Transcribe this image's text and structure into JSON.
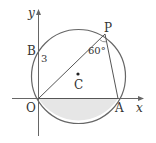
{
  "diagram": {
    "axes": {
      "x_label": "x",
      "y_label": "y"
    },
    "points": {
      "O": {
        "label": "O"
      },
      "A": {
        "label": "A"
      },
      "P": {
        "label": "P"
      },
      "B": {
        "label": "B"
      },
      "C": {
        "label": "C"
      }
    },
    "annotations": {
      "segment_OB_length": "3",
      "angle_OPA": "60°"
    },
    "colors": {
      "stroke": "#555555",
      "fill_shaded": "#e6e6e6"
    }
  }
}
